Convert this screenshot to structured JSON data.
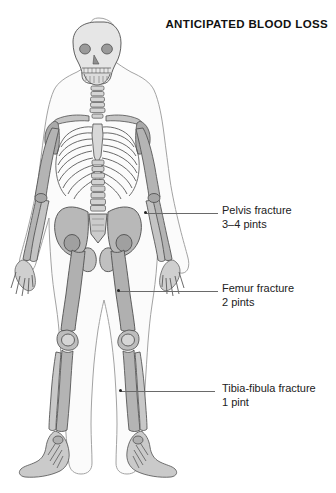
{
  "figure": {
    "title": "ANTICIPATED BLOOD LOSS",
    "background_color": "#ffffff",
    "bone_fill_color": "#c9c9c9",
    "bone_outline_color": "#555555",
    "body_outline_color": "#9a9a9a",
    "leader_line_color": "#6a6a6a",
    "text_color": "#222222"
  },
  "annotations": [
    {
      "id": "pelvis",
      "site": "Pelvis",
      "line1": "Pelvis fracture",
      "line2": "3–4 pints",
      "blood_loss_pints": "3–4",
      "anchor": {
        "x": 146,
        "y": 213
      },
      "label": {
        "x": 222,
        "y": 204
      }
    },
    {
      "id": "femur",
      "site": "Femur",
      "line1": "Femur fracture",
      "line2": "2 pints",
      "blood_loss_pints": "2",
      "anchor": {
        "x": 119,
        "y": 291
      },
      "label": {
        "x": 222,
        "y": 282
      }
    },
    {
      "id": "tibia-fibula",
      "site": "Tibia-fibula",
      "line1": "Tibia-fibula fracture",
      "line2": "1 pint",
      "blood_loss_pints": "1",
      "anchor": {
        "x": 121,
        "y": 391
      },
      "label": {
        "x": 222,
        "y": 382
      }
    }
  ]
}
